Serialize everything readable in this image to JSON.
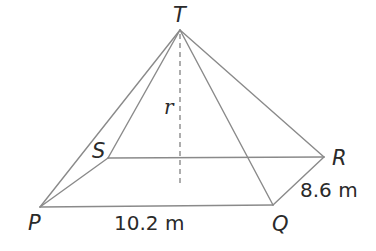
{
  "diagram": {
    "vertices": {
      "T": {
        "label": "T",
        "x": 180,
        "y": 30
      },
      "P": {
        "label": "P",
        "x": 40,
        "y": 207
      },
      "Q": {
        "label": "Q",
        "x": 273,
        "y": 205
      },
      "R": {
        "label": "R",
        "x": 324,
        "y": 157
      },
      "S": {
        "label": "S",
        "x": 108,
        "y": 158
      }
    },
    "height_label": "r",
    "measurements": {
      "PQ": "10.2 m",
      "QR": "8.6 m"
    },
    "colors": {
      "line": "#8a8a8a",
      "text": "#2a2a2a",
      "background": "#ffffff"
    }
  }
}
